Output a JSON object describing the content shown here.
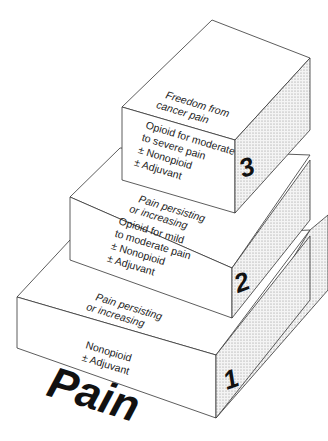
{
  "title": "Pain",
  "steps": [
    {
      "number": "1",
      "top_label": [
        "Pain persisting",
        "or increasing"
      ],
      "front_label": [
        "Nonopioid",
        "± Adjuvant"
      ]
    },
    {
      "number": "2",
      "top_label": [
        "Pain persisting",
        "or increasing"
      ],
      "front_label": [
        "Opioid for mild",
        "to moderate pain",
        "± Nonopioid",
        "± Adjuvant"
      ]
    },
    {
      "number": "3",
      "top_label": [
        "Freedom from",
        "cancer pain"
      ],
      "front_label": [
        "Opioid for moderate",
        "to severe pain",
        "± Nonopioid",
        "± Adjuvant"
      ]
    }
  ],
  "colors": {
    "line": "#333333",
    "text": "#222222",
    "shade": "#d9d9d9"
  }
}
